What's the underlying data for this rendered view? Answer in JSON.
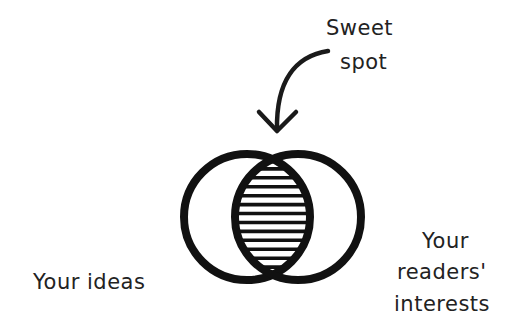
{
  "diagram": {
    "type": "venn",
    "annotation": {
      "line1": "Sweet",
      "line2": "spot",
      "points_to": "intersection"
    },
    "sets": [
      {
        "id": "left",
        "label": "Your ideas"
      },
      {
        "id": "right",
        "label_lines": [
          "Your",
          "readers'",
          "interests"
        ]
      }
    ],
    "intersection": {
      "fill": "horizontal-hatching",
      "hatch_line_count": 14
    },
    "colors": {
      "stroke": "#111111",
      "background": "#ffffff",
      "text": "#222222"
    }
  }
}
